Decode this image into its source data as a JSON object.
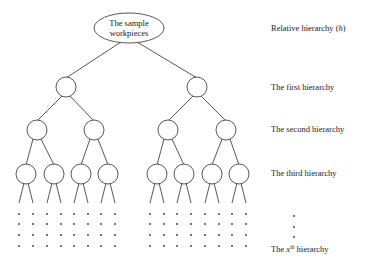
{
  "root": {
    "line1": "The sample",
    "line2": "workpieces"
  },
  "labels": {
    "relative": "Relative hierarchy (",
    "relative_var": "h",
    "relative_close": ")",
    "first": "The first hierarchy",
    "second": "The second hierarchy",
    "third": "The third hierarchy",
    "xth_prefix": "The ",
    "xth_var": "x",
    "xth_sup": "th",
    "xth_suffix": " hierarchy"
  },
  "tree": {
    "branching": 2,
    "levels_drawn": 3,
    "dot_rows": 4
  }
}
